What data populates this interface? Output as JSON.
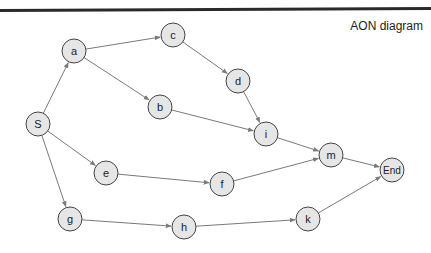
{
  "title": "AON diagram",
  "colors": {
    "node_fill": "#e6e6e6",
    "node_stroke": "#444444",
    "edge": "#7a7a7a",
    "text": "#222222"
  },
  "nodes": [
    {
      "id": "S",
      "label": "S"
    },
    {
      "id": "a",
      "label": "a"
    },
    {
      "id": "b",
      "label": "b"
    },
    {
      "id": "c",
      "label": "c"
    },
    {
      "id": "d",
      "label": "d"
    },
    {
      "id": "e",
      "label": "e"
    },
    {
      "id": "f",
      "label": "f"
    },
    {
      "id": "g",
      "label": "g"
    },
    {
      "id": "h",
      "label": "h"
    },
    {
      "id": "i",
      "label": "i"
    },
    {
      "id": "k",
      "label": "k"
    },
    {
      "id": "m",
      "label": "m"
    },
    {
      "id": "End",
      "label": "End"
    }
  ],
  "edges": [
    [
      "S",
      "a"
    ],
    [
      "S",
      "e"
    ],
    [
      "S",
      "g"
    ],
    [
      "a",
      "c"
    ],
    [
      "a",
      "b"
    ],
    [
      "c",
      "d"
    ],
    [
      "d",
      "i"
    ],
    [
      "b",
      "i"
    ],
    [
      "i",
      "m"
    ],
    [
      "e",
      "f"
    ],
    [
      "f",
      "m"
    ],
    [
      "g",
      "h"
    ],
    [
      "h",
      "k"
    ],
    [
      "m",
      "End"
    ],
    [
      "k",
      "End"
    ]
  ]
}
